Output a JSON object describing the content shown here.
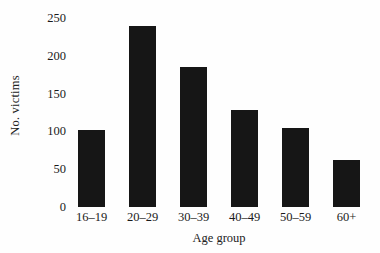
{
  "chart_data": {
    "type": "bar",
    "title": "",
    "subtitle": "",
    "xlabel": "Age group",
    "ylabel": "No. victims",
    "categories": [
      "16–19",
      "20–29",
      "30–39",
      "40–49",
      "50–59",
      "60+"
    ],
    "values": [
      102,
      240,
      185,
      128,
      105,
      62
    ],
    "series": [
      {
        "name": "No. victims",
        "values": [
          102,
          240,
          185,
          128,
          105,
          62
        ]
      }
    ],
    "ylim": [
      0,
      250
    ],
    "ytick_values": [
      0,
      50,
      100,
      150,
      200,
      250
    ],
    "ytick_labels": [
      "0",
      "50",
      "100",
      "150",
      "200",
      "250"
    ],
    "grid": false,
    "legend": false,
    "legend_position": "none",
    "bar_color": "#161616",
    "background_color": "#fefefe",
    "text_color": "#1a1a1a"
  }
}
